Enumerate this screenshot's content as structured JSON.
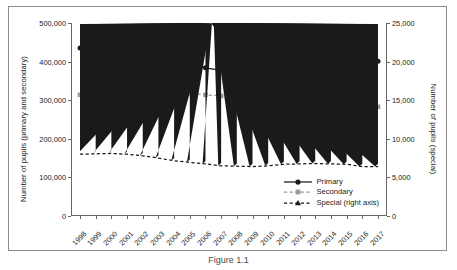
{
  "figure": {
    "caption": "Figure 1.1"
  },
  "chart_data": {
    "type": "line",
    "title": "",
    "xlabel": "",
    "grid": false,
    "legend_position": "bottom-right",
    "x": [
      1998,
      1999,
      2000,
      2001,
      2002,
      2003,
      2004,
      2005,
      2006,
      2007,
      2008,
      2009,
      2010,
      2011,
      2012,
      2013,
      2014,
      2015,
      2016,
      2017
    ],
    "xtick_labels": [
      "1998",
      "1999",
      "2000",
      "2001",
      "2002",
      "2003",
      "2004",
      "2005",
      "2006",
      "2007",
      "2008",
      "2009",
      "2010",
      "2011",
      "2012",
      "2013",
      "2014",
      "2015",
      "2016",
      "2017"
    ],
    "axes": {
      "left": {
        "label": "Number of pupils (primary and secondary)",
        "ylim": [
          0,
          500000
        ],
        "ticks": [
          0,
          100000,
          200000,
          300000,
          400000,
          500000
        ],
        "tick_labels": [
          "0",
          "100,000",
          "200,000",
          "300,000",
          "400,000",
          "500,000"
        ]
      },
      "right": {
        "label": "Number of pupils (special)",
        "ylim": [
          0,
          25000
        ],
        "ticks": [
          0,
          5000,
          10000,
          15000,
          20000,
          25000
        ],
        "tick_labels": [
          "0",
          "5,000",
          "10,000",
          "15,000",
          "20,000",
          "25,000"
        ]
      }
    },
    "series": [
      {
        "name": "Primary",
        "legend_label": "Primary",
        "axis": "left",
        "color": "#1a1a1a",
        "marker": "circle",
        "linestyle": "solid",
        "values": [
          435000,
          430000,
          425000,
          420000,
          414000,
          407000,
          399000,
          391000,
          384000,
          377000,
          372000,
          368000,
          366000,
          367000,
          371000,
          378000,
          385000,
          392000,
          397000,
          401000
        ]
      },
      {
        "name": "Secondary",
        "legend_label": "Secondary",
        "axis": "left",
        "color": "#9a9a9a",
        "marker": "square",
        "linestyle": "dashed",
        "values": [
          314000,
          316000,
          319000,
          318000,
          319000,
          320000,
          320000,
          318000,
          314000,
          311000,
          306000,
          304000,
          302000,
          300000,
          296000,
          291000,
          287000,
          284000,
          282000,
          283000
        ]
      },
      {
        "name": "Special (right axis)",
        "legend_label": "Special (right axis)",
        "axis": "right",
        "color": "#1a1a1a",
        "marker": "triangle",
        "linestyle": "dashed",
        "values": [
          8000,
          8050,
          8100,
          8000,
          7800,
          7500,
          7150,
          6950,
          6750,
          6500,
          6450,
          6400,
          6500,
          6700,
          6750,
          6800,
          6750,
          6700,
          6400,
          6400
        ]
      }
    ]
  }
}
